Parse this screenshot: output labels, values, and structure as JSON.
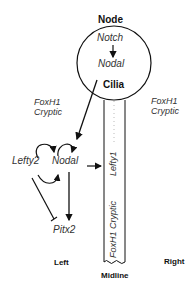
{
  "diagram": {
    "node": {
      "title": "Node",
      "upstream": "Notch",
      "downstream": "Nodal",
      "structure": "Cilia"
    },
    "left_side": {
      "factors_line1": "FoxH1",
      "factors_line2": "Cryptic",
      "gene_a": "Lefty2",
      "gene_b": "Nodal",
      "target": "Pitx2",
      "label": "Left"
    },
    "right_side": {
      "factors_line1": "FoxH1",
      "factors_line2": "Cryptic",
      "label": "Right"
    },
    "midline": {
      "gene": "Lefty1",
      "factors": "FoxH1 Cryptic",
      "label": "Midline"
    },
    "colors": {
      "line": "#111111",
      "text": "#333333",
      "dotted": "#bbbbbb"
    }
  }
}
